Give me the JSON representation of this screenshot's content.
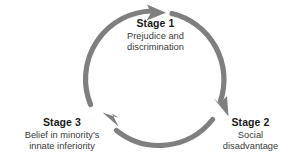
{
  "diagram": {
    "type": "cycle-diagram",
    "title": "",
    "direction": "clockwise",
    "colors": {
      "arc": "#7f7f7f",
      "arrow": "#7f7f7f",
      "title_text": "#1a1a1a",
      "body_text": "#3a3a3a",
      "background": "#ffffff"
    },
    "stages": [
      {
        "id": "stage-1",
        "title": "Stage 1",
        "description_lines": [
          "Prejudice and",
          "discrimination"
        ],
        "position": "top"
      },
      {
        "id": "stage-2",
        "title": "Stage 2",
        "description_lines": [
          "Social",
          "disadvantage"
        ],
        "position": "bottom-right"
      },
      {
        "id": "stage-3",
        "title": "Stage 3",
        "description_lines": [
          "Belief in minority's",
          "innate inferiority"
        ],
        "position": "bottom-left"
      }
    ],
    "arrows": [
      {
        "id": "arrow-to-stage-1",
        "from": "stage-3",
        "to": "stage-1"
      },
      {
        "id": "arrow-to-stage-2",
        "from": "stage-1",
        "to": "stage-2"
      },
      {
        "id": "arrow-to-stage-3",
        "from": "stage-2",
        "to": "stage-3"
      }
    ]
  }
}
